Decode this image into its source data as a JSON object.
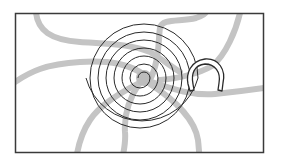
{
  "diagram": {
    "colors": {
      "background": "#ffffff",
      "frame": "#3a3a3a",
      "roads": "#c4c4c4",
      "spiral": "#2a2a2a",
      "magnet_fill": "#ffffff",
      "magnet_stroke": "#2a2a2a"
    },
    "frame": {
      "x": 15,
      "y": 13,
      "width": 249,
      "height": 140
    },
    "spiral": {
      "center_x": 144,
      "center_y": 78,
      "turns": 5,
      "max_radius": 58
    },
    "elements": [
      {
        "name": "frame",
        "icon": "rectangle-frame"
      },
      {
        "name": "roads",
        "icon": "road-lines"
      },
      {
        "name": "spiral",
        "icon": "spiral-icon"
      },
      {
        "name": "magnet",
        "icon": "horseshoe-magnet-icon"
      }
    ]
  }
}
